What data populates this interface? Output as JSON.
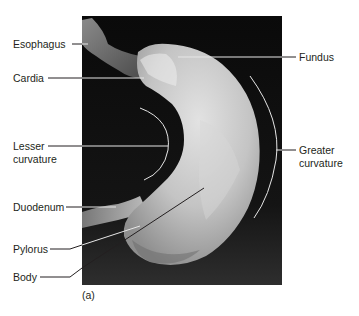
{
  "figure": {
    "caption": "(a)",
    "colors": {
      "background": "#ffffff",
      "photo_background": "#0b0b0b",
      "tissue_light": "#d9d9d9",
      "tissue_mid": "#a8a8a8",
      "leader_line_dark": "#231f20",
      "leader_line_light": "#e6e6e6",
      "label_text": "#231f20"
    }
  },
  "labels": {
    "left": [
      {
        "id": "esophagus",
        "text": "Esophagus"
      },
      {
        "id": "cardia",
        "text": "Cardia"
      },
      {
        "id": "lesser_curvature_1",
        "text": "Lesser"
      },
      {
        "id": "lesser_curvature_2",
        "text": "curvature"
      },
      {
        "id": "duodenum",
        "text": "Duodenum"
      },
      {
        "id": "pylorus",
        "text": "Pylorus"
      },
      {
        "id": "body",
        "text": "Body"
      }
    ],
    "right": [
      {
        "id": "fundus",
        "text": "Fundus"
      },
      {
        "id": "greater_curvature_1",
        "text": "Greater"
      },
      {
        "id": "greater_curvature_2",
        "text": "curvature"
      }
    ]
  }
}
